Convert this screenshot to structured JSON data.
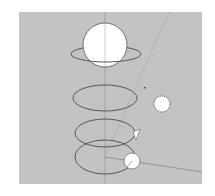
{
  "viewport": {
    "background": "#c3c3c3",
    "axis_color": "#8a8a8a",
    "stroke_color": "#555555",
    "fill_color": "#ffffff"
  },
  "scene": {
    "objects": [
      {
        "name": "planet-with-ring",
        "type": "sphere+ring"
      },
      {
        "name": "orbit-ellipse-1",
        "type": "ellipse"
      },
      {
        "name": "sun",
        "type": "spiky-sphere"
      },
      {
        "name": "orbit-ellipse-2",
        "type": "ellipse"
      },
      {
        "name": "orbit-ellipse-3",
        "type": "ellipse"
      },
      {
        "name": "moon",
        "type": "sphere"
      },
      {
        "name": "cone-marker",
        "type": "wedge"
      }
    ]
  }
}
